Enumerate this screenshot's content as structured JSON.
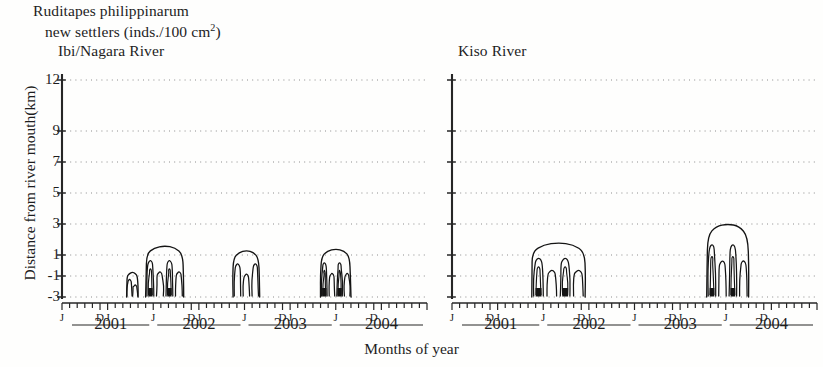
{
  "figure": {
    "header_line1": "Ruditapes philippinarum",
    "header_line2_pre": "new settlers (inds./100 cm",
    "header_line2_sup": "2",
    "header_line2_post": ")",
    "y_axis_label": "Distance from river mouth(km)",
    "x_axis_label": "Months of year"
  },
  "panels": [
    {
      "id": "ibi-nagara",
      "title": "Ibi/Nagara River"
    },
    {
      "id": "kiso",
      "title": "Kiso River"
    }
  ],
  "axes": {
    "y_ticks": [
      "12",
      "9",
      "7",
      "5",
      "3",
      "1",
      "-1",
      "-3"
    ],
    "y_tick_values": [
      12,
      9,
      7,
      5,
      3,
      1,
      -1,
      -3
    ],
    "x_years": [
      "2001",
      "2002",
      "2003",
      "2004"
    ],
    "x_month_marks": [
      "J",
      "J",
      "D"
    ],
    "x_range_months": [
      6,
      54
    ]
  },
  "chart_data": {
    "type": "contour",
    "title": "Ruditapes philippinarum new settlers (inds./100 cm2)",
    "xlabel": "Months of year",
    "ylabel": "Distance from river mouth(km)",
    "ylim": [
      -3,
      12
    ],
    "y_ticks": [
      12,
      9,
      7,
      5,
      3,
      1,
      -1,
      -3
    ],
    "x_tick_labels": [
      "J",
      "J",
      "D",
      "J",
      "J",
      "D",
      "J",
      "J",
      "D",
      "J",
      "J",
      "D"
    ],
    "x_year_labels": [
      "2001",
      "2002",
      "2003",
      "2004"
    ],
    "grid": "dotted horizontal gridlines at each y tick",
    "legend": "none",
    "series": [
      {
        "name": "Ibi/Nagara River",
        "panel": "left",
        "clusters": [
          {
            "label": "2002 minor",
            "time_months": [
              14.5,
              16.0
            ],
            "y_extent": [
              -3.0,
              -0.6
            ],
            "peak_level": 1
          },
          {
            "label": "2002 main",
            "time_months": [
              17.0,
              22.0
            ],
            "y_extent": [
              -3.0,
              1.6
            ],
            "peak_level": 3
          },
          {
            "label": "2003",
            "time_months": [
              28.5,
              32.0
            ],
            "y_extent": [
              -3.0,
              1.3
            ],
            "peak_level": 2
          },
          {
            "label": "2004",
            "time_months": [
              40.0,
              44.0
            ],
            "y_extent": [
              -3.0,
              1.4
            ],
            "peak_level": 3
          }
        ]
      },
      {
        "name": "Kiso River",
        "panel": "right",
        "clusters": [
          {
            "label": "2002 main",
            "time_months": [
              16.5,
              23.5
            ],
            "y_extent": [
              -3.0,
              1.8
            ],
            "peak_level": 4
          },
          {
            "label": "2004",
            "time_months": [
              39.5,
              45.0
            ],
            "y_extent": [
              -3.0,
              3.0
            ],
            "peak_level": 4
          }
        ]
      }
    ]
  }
}
